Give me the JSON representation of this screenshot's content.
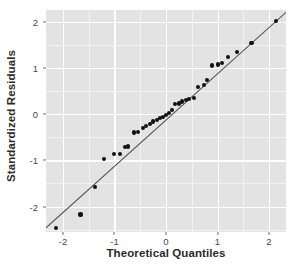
{
  "chart_data": {
    "type": "scatter",
    "title": "",
    "subtitle": "",
    "xlabel": "Theoretical Quantiles",
    "ylabel": "Standardized Residuals",
    "xlim": [
      -2.33,
      2.33
    ],
    "ylim": [
      -2.55,
      2.25
    ],
    "grid": true,
    "legend": null,
    "x_ticks": [
      -2,
      -1,
      0,
      1,
      2
    ],
    "x_tick_labels": [
      "-2",
      "-1",
      "0",
      "1",
      "2"
    ],
    "y_ticks": [
      -2,
      -1,
      0,
      1,
      2
    ],
    "y_tick_labels": [
      "-2",
      "-1",
      "0",
      "1",
      "2"
    ],
    "panel_background": "#e3e3e3",
    "gridline_color": "#ffffff",
    "point_color": "#111111",
    "line_color": "#555555",
    "series": [
      {
        "name": "Standardized residuals",
        "marker": "filled-circle",
        "x": [
          -2.14,
          -1.66,
          -1.38,
          -1.21,
          -1.01,
          -0.89,
          -0.8,
          -0.73,
          -0.62,
          -0.55,
          -0.45,
          -0.39,
          -0.31,
          -0.25,
          -0.18,
          -0.12,
          -0.06,
          0.0,
          0.06,
          0.12,
          0.18,
          0.25,
          0.31,
          0.39,
          0.45,
          0.55,
          0.62,
          0.73,
          0.8,
          0.89,
          1.01,
          1.08,
          1.21,
          1.38,
          1.66,
          2.14
        ],
        "y": [
          -2.46,
          -2.17,
          -1.57,
          -0.97,
          -0.87,
          -0.86,
          -0.72,
          -0.7,
          -0.4,
          -0.38,
          -0.3,
          -0.25,
          -0.22,
          -0.16,
          -0.13,
          -0.09,
          -0.06,
          -0.02,
          0.03,
          0.09,
          0.22,
          0.23,
          0.27,
          0.3,
          0.32,
          0.34,
          0.59,
          0.62,
          0.73,
          1.05,
          1.07,
          1.11,
          1.24,
          1.34,
          1.53,
          2.01
        ]
      }
    ],
    "reference_line": {
      "name": "qq-reference-line",
      "x1": -2.33,
      "y1": -2.46,
      "x2": 2.33,
      "y2": 2.2
    }
  }
}
